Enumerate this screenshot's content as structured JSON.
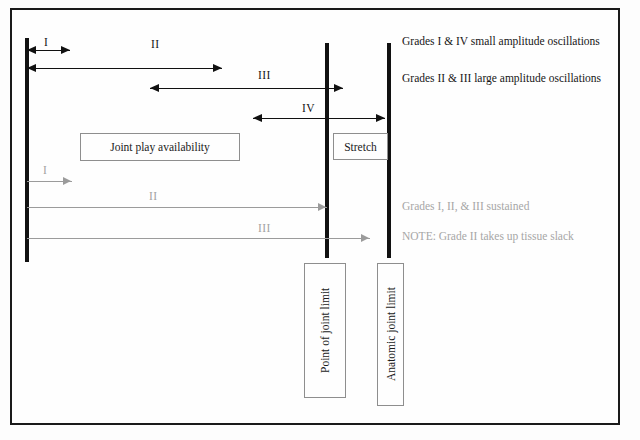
{
  "diagram": {
    "colors": {
      "line_black": "#111111",
      "line_gray": "#9b9b9b",
      "text_black": "#161616",
      "text_gray": "#a6a6a6",
      "frame": "#1a1a1a"
    },
    "reference_lines": [
      {
        "name": "resting-position-line",
        "x": 25,
        "y": 38,
        "height": 224,
        "width": 4
      },
      {
        "name": "point-of-joint-limit-line",
        "x": 325,
        "y": 43,
        "height": 215,
        "width": 4
      },
      {
        "name": "anatomic-joint-limit-line",
        "x": 387,
        "y": 43,
        "height": 215,
        "width": 4
      }
    ],
    "oscillation_arrows": [
      {
        "grade": "I",
        "label": "I",
        "style": "black",
        "heads": "both",
        "x1": 27,
        "x2": 70,
        "y": 50,
        "label_x": 44,
        "label_y": 36
      },
      {
        "grade": "II",
        "label": "II",
        "style": "black",
        "heads": "both",
        "x1": 27,
        "x2": 222,
        "y": 68,
        "label_x": 151,
        "label_y": 38
      },
      {
        "grade": "III",
        "label": "III",
        "style": "black",
        "heads": "both",
        "x1": 150,
        "x2": 343,
        "y": 88,
        "label_x": 258,
        "label_y": 69
      },
      {
        "grade": "IV",
        "label": "IV",
        "style": "black",
        "heads": "both",
        "x1": 253,
        "x2": 385,
        "y": 118,
        "label_x": 302,
        "label_y": 102
      }
    ],
    "sustained_arrows": [
      {
        "grade": "I",
        "label": "I",
        "style": "gray",
        "heads": "right",
        "x1": 27,
        "x2": 72,
        "y": 181,
        "label_x": 43,
        "label_y": 164
      },
      {
        "grade": "II",
        "label": "II",
        "style": "gray",
        "heads": "right",
        "x1": 27,
        "x2": 327,
        "y": 207,
        "label_x": 149,
        "label_y": 190
      },
      {
        "grade": "III",
        "label": "III",
        "style": "gray",
        "heads": "right",
        "x1": 27,
        "x2": 370,
        "y": 238,
        "label_x": 258,
        "label_y": 222
      }
    ],
    "boxes": [
      {
        "name": "joint-play-availability-box",
        "text": "Joint play availability",
        "x": 80,
        "y": 133,
        "width": 160,
        "height": 28,
        "orientation": "horizontal"
      },
      {
        "name": "stretch-box",
        "text": "Stretch",
        "x": 333,
        "y": 133,
        "width": 55,
        "height": 27,
        "orientation": "horizontal"
      },
      {
        "name": "point-of-joint-limit-box",
        "text": "Point of joint limit",
        "x": 304,
        "y": 263,
        "width": 42,
        "height": 135,
        "orientation": "vertical"
      },
      {
        "name": "anatomic-joint-limit-box",
        "text": "Anatomic joint limit",
        "x": 377,
        "y": 263,
        "width": 27,
        "height": 143,
        "orientation": "vertical"
      }
    ],
    "legend": [
      {
        "name": "legend-small-amplitude",
        "text": "Grades I & IV small amplitude oscillations",
        "style": "black",
        "x": 402,
        "y": 35
      },
      {
        "name": "legend-large-amplitude",
        "text": "Grades II & III large amplitude oscillations",
        "style": "black",
        "x": 402,
        "y": 72
      },
      {
        "name": "legend-sustained",
        "text": "Grades I, II, & III sustained",
        "style": "gray",
        "x": 402,
        "y": 200
      },
      {
        "name": "legend-note",
        "text": "NOTE: Grade II takes up tissue slack",
        "style": "gray",
        "x": 402,
        "y": 230
      }
    ]
  }
}
